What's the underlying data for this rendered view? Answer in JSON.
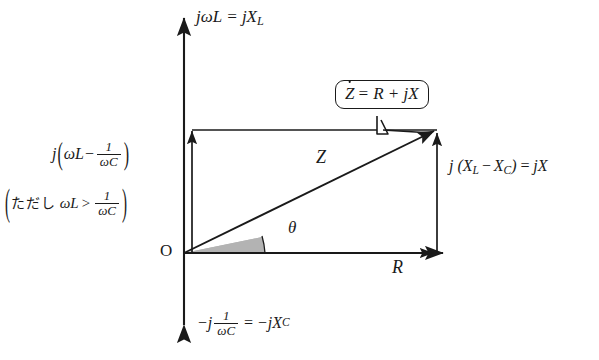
{
  "diagram": {
    "background_color": "#ffffff",
    "line_color": "#1a1a1a",
    "wedge_fill_color": "#b3b3b3",
    "axes": {
      "imaginary_positive_label": "jωL = jX_L",
      "imaginary_negative_label": "−j (1/ωC) = −jX_C",
      "real_axis_label": "R",
      "origin_label": "O"
    },
    "labels": {
      "omega": "ω",
      "j": "j",
      "one": "1",
      "omega_c": "ωC",
      "omega_l": "ωL",
      "minus": "−",
      "greater": ">",
      "equals": "=",
      "jx_l": "jX",
      "sub_l": "L",
      "sub_c": "C",
      "neg_j": "−j",
      "neg_jx_c": "−jX",
      "left_paren": "(",
      "right_paren": ")",
      "tadashi": "ただし",
      "vector_magnitude": "Z",
      "angle": "θ",
      "x_l": "X",
      "x_c": "X",
      "jx": "jX",
      "j_open": "j ("
    },
    "callout": {
      "text_z": "Z",
      "text_rest": "= R + jX",
      "full": "Ż = R + jX"
    },
    "right_label": {
      "full": "j (X_L − X_C) = jX"
    },
    "left_label": {
      "line1": "j (ωL − 1/ωC)",
      "line2": "(ただし ωL > 1/ωC)"
    }
  }
}
